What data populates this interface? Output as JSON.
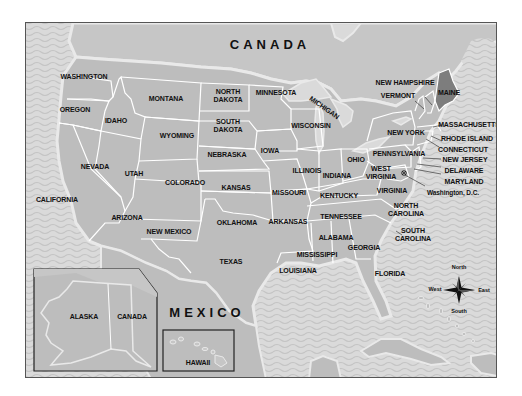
{
  "map": {
    "title": "United States map",
    "colors": {
      "land": "#bdbdbd",
      "canada": "#c6c6c6",
      "water": "#dadada",
      "wave": "#c8c8c8",
      "coast_halo": "#e9e9e9",
      "highlight_state": "#7d7d7d",
      "border": "#ffffff",
      "frame": "#333333"
    },
    "countries": {
      "canada": "CANADA",
      "mexico": "MEXICO"
    },
    "states": {
      "washington": "WASHINGTON",
      "oregon": "OREGON",
      "california": "CALIFORNIA",
      "nevada": "NEVADA",
      "idaho": "IDAHO",
      "montana": "MONTANA",
      "wyoming": "WYOMING",
      "utah": "UTAH",
      "arizona": "ARIZONA",
      "colorado": "COLORADO",
      "new_mexico": "NEW MEXICO",
      "north_dakota": "NORTH DAKOTA",
      "south_dakota": "SOUTH DAKOTA",
      "nebraska": "NEBRASKA",
      "kansas": "KANSAS",
      "oklahoma": "OKLAHOMA",
      "texas": "TEXAS",
      "minnesota": "MINNESOTA",
      "iowa": "IOWA",
      "missouri": "MISSOURI",
      "arkansas": "ARKANSAS",
      "louisiana": "LOUISIANA",
      "wisconsin": "WISCONSIN",
      "michigan": "MICHIGAN",
      "illinois": "ILLINOIS",
      "indiana": "INDIANA",
      "ohio": "OHIO",
      "kentucky": "KENTUCKY",
      "tennessee": "TENNESSEE",
      "mississippi": "MISSISSIPPI",
      "alabama": "ALABAMA",
      "georgia": "GEORGIA",
      "florida": "FLORIDA",
      "south_carolina": "SOUTH CAROLINA",
      "north_carolina": "NORTH CAROLINA",
      "virginia": "VIRGINIA",
      "west_virginia": "WEST VIRGINIA",
      "pennsylvania": "PENNSYLVANIA",
      "new_york": "NEW YORK",
      "vermont": "VERMONT",
      "new_hampshire": "NEW HAMPSHIRE",
      "maine": "MAINE",
      "massachusetts": "MASSACHUSETTS",
      "rhode_island": "RHODE ISLAND",
      "connecticut": "CONNECTICUT",
      "new_jersey": "NEW JERSEY",
      "delaware": "DELAWARE",
      "maryland": "MARYLAND",
      "washington_dc": "Washington, D.C."
    },
    "insets": {
      "alaska": {
        "state": "ALASKA",
        "neighbor": "CANADA"
      },
      "hawaii": {
        "state": "HAWAII"
      }
    },
    "compass": {
      "north": "North",
      "south": "South",
      "east": "East",
      "west": "West"
    }
  }
}
